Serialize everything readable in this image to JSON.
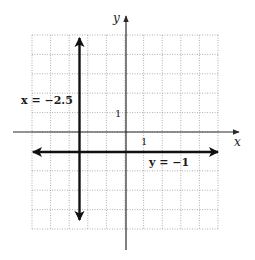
{
  "figure": {
    "type": "coordinate-plane",
    "grid": {
      "x_min": -5,
      "x_max": 5,
      "y_min": -5,
      "y_max": 5,
      "step": 1,
      "style": "dotted"
    },
    "axes": {
      "x_label": "x",
      "y_label": "y"
    },
    "tick_labels": {
      "x_one": "1",
      "y_one": "1"
    },
    "lines": [
      {
        "id": "vertical",
        "equation": "x = −2.5",
        "orientation": "vertical",
        "value": -2.5
      },
      {
        "id": "horizontal",
        "equation": "y = −1",
        "orientation": "horizontal",
        "value": -1
      }
    ],
    "colors": {
      "grid": "#9a9a9a",
      "axis": "#2a2a2a",
      "line": "#111111"
    }
  }
}
